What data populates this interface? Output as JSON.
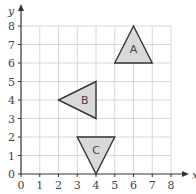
{
  "diagram": {
    "type": "coordinate-grid",
    "x_axis": {
      "label": "x",
      "min": 0,
      "max": 8,
      "ticks": [
        "0",
        "1",
        "2",
        "3",
        "4",
        "5",
        "6",
        "7",
        "8"
      ]
    },
    "y_axis": {
      "label": "y",
      "min": 0,
      "max": 8,
      "ticks": [
        "0",
        "1",
        "2",
        "3",
        "4",
        "5",
        "6",
        "7",
        "8"
      ]
    },
    "colors": {
      "grid": "#d8d8d8",
      "axis": "#333333",
      "shape_fill": "#d9d9d9",
      "shape_stroke": "#333333",
      "text": "#444444"
    },
    "shapes": [
      {
        "label": "A",
        "vertices": [
          [
            5,
            6
          ],
          [
            7,
            6
          ],
          [
            6,
            8
          ]
        ],
        "label_pos": [
          6,
          6.75
        ]
      },
      {
        "label": "B",
        "vertices": [
          [
            4,
            5
          ],
          [
            4,
            3
          ],
          [
            2,
            4
          ]
        ],
        "label_pos": [
          3.4,
          4
        ]
      },
      {
        "label": "C",
        "vertices": [
          [
            3,
            2
          ],
          [
            5,
            2
          ],
          [
            4,
            0
          ]
        ],
        "label_pos": [
          4,
          1.3
        ]
      }
    ]
  }
}
